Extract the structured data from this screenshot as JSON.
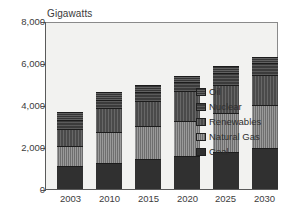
{
  "chart_data": {
    "type": "bar",
    "stacked": true,
    "title": "Gigawatts",
    "xlabel": "",
    "ylabel": "",
    "ylim": [
      0,
      8000
    ],
    "yticks": [
      "0",
      "2,000",
      "4,000",
      "6,000",
      "8,000"
    ],
    "ytick_values": [
      0,
      2000,
      4000,
      6000,
      8000
    ],
    "grid": false,
    "legend_position": "inside-right",
    "categories": [
      "2003",
      "2010",
      "2015",
      "2020",
      "2025",
      "2030"
    ],
    "series": [
      {
        "name": "Coal",
        "key": "coal",
        "values": [
          1150,
          1300,
          1500,
          1600,
          1800,
          2000
        ]
      },
      {
        "name": "Natural Gas",
        "key": "gas",
        "values": [
          950,
          1450,
          1550,
          1700,
          1850,
          2050
        ]
      },
      {
        "name": "Renewables",
        "key": "renew",
        "values": [
          800,
          1150,
          1200,
          1400,
          1350,
          1450
        ]
      },
      {
        "name": "Nuclear",
        "key": "nuclear",
        "values": [
          450,
          400,
          400,
          450,
          550,
          550
        ]
      },
      {
        "name": "Oil",
        "key": "oil",
        "values": [
          350,
          350,
          350,
          300,
          350,
          300
        ]
      }
    ],
    "totals": [
      3700,
      4650,
      5000,
      5450,
      5900,
      6350
    ]
  },
  "legend": {
    "items": [
      {
        "label": "Oil",
        "key": "oil"
      },
      {
        "label": "Nuclear",
        "key": "nuclear"
      },
      {
        "label": "Renewables",
        "key": "renew"
      },
      {
        "label": "Natural Gas",
        "key": "gas"
      },
      {
        "label": "Coal",
        "key": "coal"
      }
    ]
  },
  "colors": {
    "coal": "#303030",
    "gas": "#6e6e6e",
    "renew": "#4a4a4a",
    "nuclear": "#3b3b3b",
    "oil": "#353535",
    "plot_background": "#f2f2f0",
    "axis": "#5a5a5a",
    "text": "#3c3c3c",
    "page_background": "#ffffff"
  }
}
